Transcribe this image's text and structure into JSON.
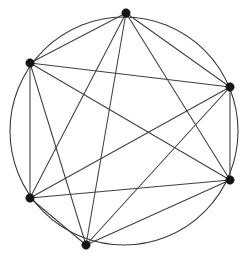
{
  "figure": {
    "background_color": "#ffffff",
    "width": 249,
    "height": 264
  },
  "chart_data": {
    "type": "diagram",
    "diagram_kind": "graph",
    "graph_name": "K6",
    "vertex_count": 6,
    "edge_count": 15,
    "directed": false,
    "labels_shown": false,
    "circle": {
      "center_x": 124,
      "center_y": 131,
      "radius": 114,
      "stroke_color": "#3a3a3a",
      "stroke_width": 1.1
    },
    "vertex_style": {
      "shape": "filled-circle",
      "radius": 4.2,
      "color": "#151515"
    },
    "edge_style": {
      "color": "#3f3f3f",
      "stroke_width": 1.05
    },
    "vertices": [
      {
        "id": "v1",
        "name": "top",
        "x": 126,
        "y": 13,
        "angle_deg": 89
      },
      {
        "id": "v2",
        "name": "upper-left",
        "x": 30,
        "y": 63,
        "angle_deg": 149
      },
      {
        "id": "v3",
        "name": "upper-right",
        "x": 230,
        "y": 87,
        "angle_deg": 23
      },
      {
        "id": "v4",
        "name": "lower-left",
        "x": 30,
        "y": 198,
        "angle_deg": 211
      },
      {
        "id": "v5",
        "name": "lower-right",
        "x": 230,
        "y": 180,
        "angle_deg": 336
      },
      {
        "id": "v6",
        "name": "bottom",
        "x": 86,
        "y": 245,
        "angle_deg": 253
      }
    ],
    "edges": [
      {
        "from": "v1",
        "to": "v2"
      },
      {
        "from": "v1",
        "to": "v3"
      },
      {
        "from": "v1",
        "to": "v4"
      },
      {
        "from": "v1",
        "to": "v5"
      },
      {
        "from": "v1",
        "to": "v6"
      },
      {
        "from": "v2",
        "to": "v3"
      },
      {
        "from": "v2",
        "to": "v4"
      },
      {
        "from": "v2",
        "to": "v5"
      },
      {
        "from": "v2",
        "to": "v6"
      },
      {
        "from": "v3",
        "to": "v4"
      },
      {
        "from": "v3",
        "to": "v5"
      },
      {
        "from": "v3",
        "to": "v6"
      },
      {
        "from": "v4",
        "to": "v5"
      },
      {
        "from": "v4",
        "to": "v6"
      },
      {
        "from": "v5",
        "to": "v6"
      }
    ]
  }
}
